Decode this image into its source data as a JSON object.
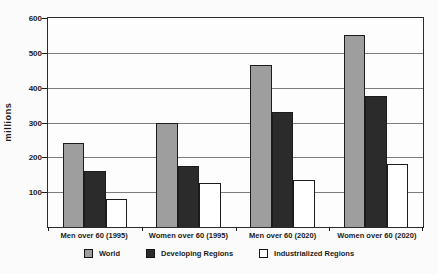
{
  "chart_data": {
    "type": "bar",
    "title": "",
    "ylabel": "millions",
    "xlabel": "",
    "categories": [
      "Men over 60 (1995)",
      "Women over 60 (1995)",
      "Men over 60 (2020)",
      "Women over 60 (2020)"
    ],
    "series": [
      {
        "name": "World",
        "color": "#9e9e9e",
        "values": [
          240,
          300,
          465,
          550
        ]
      },
      {
        "name": "Developing Regions",
        "color": "#2b2b2b",
        "values": [
          160,
          175,
          330,
          375
        ]
      },
      {
        "name": "Industrialized Regions",
        "color": "#ffffff",
        "values": [
          80,
          125,
          135,
          180
        ]
      }
    ],
    "ylim": [
      0,
      600
    ],
    "yticks": [
      100,
      200,
      300,
      400,
      500,
      600
    ],
    "grid": true,
    "legend_position": "bottom",
    "colors": {
      "axis": "#1c1c1c",
      "gridline": "#7d7d7d",
      "text": "#1a1a1a",
      "plot_background": "#fdfdfd",
      "figure_background": "#fbfbfb",
      "bar_border": "#1c1c1c"
    }
  }
}
